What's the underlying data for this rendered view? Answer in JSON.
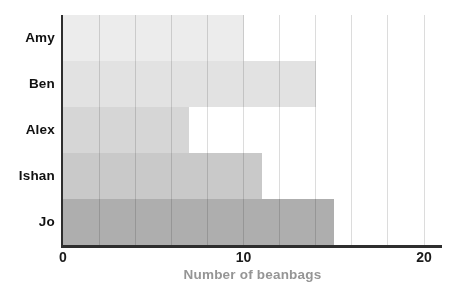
{
  "chart_data": {
    "type": "bar",
    "orientation": "horizontal",
    "title": "",
    "xlabel": "Number of beanbags",
    "ylabel": "",
    "categories": [
      "Amy",
      "Ben",
      "Alex",
      "Ishan",
      "Jo"
    ],
    "values": [
      10,
      14,
      7,
      11,
      15
    ],
    "xlim": [
      0,
      21
    ],
    "xticks": [
      "0",
      "10",
      "20"
    ],
    "xtick_values": [
      0,
      10,
      20
    ],
    "gridlines": {
      "axis": "x",
      "on": true,
      "step": 2,
      "min": 2,
      "max": 20
    },
    "legend": "none",
    "colors": {
      "bars": [
        "#ececec",
        "#e2e2e2",
        "#d6d6d6",
        "#c9c9c9",
        "#aeaeae"
      ],
      "gridline": "#dcdcdc",
      "axis": "#2e2e2e",
      "tick_label": "#1a1a1a",
      "category_label": "#111111",
      "xlabel": "#959595",
      "background": "#ffffff"
    }
  }
}
